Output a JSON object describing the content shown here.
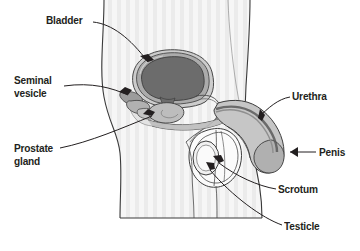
{
  "diagram": {
    "background_color": "#ffffff",
    "ink_color": "#231f20",
    "body_fill": "#f4f4f4",
    "organ_fills": {
      "bladder_interior": "#6a6a6a",
      "bladder_wall": "#a8a8a8",
      "bladder_outer": "#c9c9c9",
      "prostate": "#b5b5b5",
      "seminal_vesicle": "#9e9e9e",
      "urethra_tube": "#8f8f8f",
      "penis_shaft": "#c0c0c0",
      "scrotum": "#ffffff",
      "testicle": "#f2f2f2"
    },
    "labels": [
      {
        "id": "bladder",
        "text": "Bladder",
        "pointer": "arrow"
      },
      {
        "id": "seminal",
        "text": "Seminal\nvesicle",
        "pointer": "arrow"
      },
      {
        "id": "prostate",
        "text": "Prostate\ngland",
        "pointer": "arrow"
      },
      {
        "id": "urethra",
        "text": "Urethra",
        "pointer": "arrow"
      },
      {
        "id": "penis",
        "text": "Penis",
        "pointer": "arrow"
      },
      {
        "id": "scrotum",
        "text": "Scrotum",
        "pointer": "arrow"
      },
      {
        "id": "testicle",
        "text": "Testicle",
        "pointer": "arrow"
      }
    ]
  }
}
